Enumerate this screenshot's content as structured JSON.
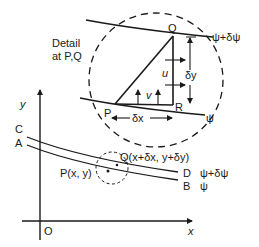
{
  "figure": {
    "detail_label_line1": "Detail",
    "detail_label_line2": "at P,Q",
    "detail": {
      "point_q": "Q",
      "point_p": "P",
      "point_r": "R",
      "velocity_u": "u",
      "velocity_v": "v",
      "delta_y": "δy",
      "delta_x": "δx",
      "upper_streamline": "ψ+δψ",
      "lower_streamline": "ψ"
    },
    "axes": {
      "x_label": "x",
      "y_label": "y",
      "origin_label": "O"
    },
    "streamlines": {
      "c_label": "C",
      "a_label": "A",
      "d_label": "D",
      "b_label": "B",
      "d_value": "ψ+δψ",
      "b_value": "ψ"
    },
    "points": {
      "q_label": "Q(x+δx, y+δy)",
      "p_label": "P(x, y)"
    },
    "colors": {
      "ink": "#1a1a1a",
      "background": "#ffffff"
    }
  }
}
